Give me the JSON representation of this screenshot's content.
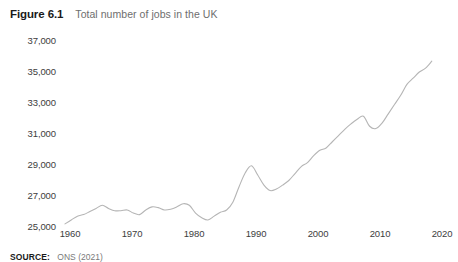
{
  "header": {
    "figure_number": "Figure 6.1",
    "figure_title": "Total number of jobs in the UK"
  },
  "source": {
    "label": "SOURCE:",
    "text": "ONS (2021)"
  },
  "colors": {
    "line": "#b5b5b5",
    "title_bold": "#1a1a1a",
    "title_light": "#6e6e6e",
    "tick_text": "#3d3d3d",
    "background": "#ffffff"
  },
  "axes": {
    "y_ticks": [
      "37,000",
      "35,000",
      "33,000",
      "31,000",
      "29,000",
      "27,000",
      "25,000"
    ],
    "x_ticks": [
      "1960",
      "1970",
      "1980",
      "1990",
      "2000",
      "2010",
      "2020"
    ]
  },
  "chart_data": {
    "type": "line",
    "title": "Total number of jobs in the UK",
    "xlabel": "",
    "ylabel": "",
    "xlim": [
      1960,
      2020
    ],
    "ylim": [
      25000,
      37000
    ],
    "grid": false,
    "legend": false,
    "yticks": [
      25000,
      27000,
      29000,
      31000,
      33000,
      35000,
      37000
    ],
    "ytick_labels": [
      "25,000",
      "27,000",
      "29,000",
      "31,000",
      "33,000",
      "35,000",
      "37,000"
    ],
    "xticks": [
      1960,
      1970,
      1980,
      1990,
      2000,
      2010,
      2020
    ],
    "xtick_labels": [
      "1960",
      "1970",
      "1980",
      "1990",
      "2000",
      "2010",
      "2020"
    ],
    "units": "thousands of jobs",
    "source": "ONS (2021)",
    "series": [
      {
        "name": "Total jobs in the UK",
        "x": [
          1960,
          1961,
          1962,
          1963,
          1964,
          1965,
          1966,
          1967,
          1968,
          1969,
          1970,
          1971,
          1972,
          1973,
          1974,
          1975,
          1976,
          1977,
          1978,
          1979,
          1980,
          1981,
          1982,
          1983,
          1984,
          1985,
          1986,
          1987,
          1988,
          1989,
          1990,
          1991,
          1992,
          1993,
          1994,
          1995,
          1996,
          1997,
          1998,
          1999,
          2000,
          2001,
          2002,
          2003,
          2004,
          2005,
          2006,
          2007,
          2008,
          2009,
          2010,
          2011,
          2012,
          2013,
          2014,
          2015,
          2016,
          2017,
          2018,
          2019
        ],
        "values": [
          25200,
          25450,
          25700,
          25800,
          26000,
          26200,
          26400,
          26200,
          26050,
          26050,
          26100,
          25900,
          25800,
          26100,
          26300,
          26250,
          26100,
          26150,
          26300,
          26500,
          26400,
          25900,
          25600,
          25450,
          25700,
          25950,
          26100,
          26600,
          27600,
          28500,
          28950,
          28350,
          27700,
          27350,
          27450,
          27700,
          28000,
          28450,
          28900,
          29150,
          29600,
          29950,
          30100,
          30500,
          30900,
          31300,
          31650,
          31950,
          32150,
          31500,
          31350,
          31700,
          32300,
          32900,
          33500,
          34200,
          34600,
          35000,
          35250,
          35700
        ]
      }
    ],
    "annotations": [
      {
        "label": "1966 local peak",
        "x": 1966,
        "y": 26400
      },
      {
        "label": "1983 trough",
        "x": 1983,
        "y": 25450
      },
      {
        "label": "1990 peak",
        "x": 1990,
        "y": 28950
      },
      {
        "label": "1993 trough",
        "x": 1993,
        "y": 27350
      },
      {
        "label": "2008 peak",
        "x": 2008,
        "y": 32150
      },
      {
        "label": "2009 recession trough",
        "x": 2009,
        "y": 31500
      },
      {
        "label": "2019 end",
        "x": 2019,
        "y": 35700
      }
    ]
  }
}
